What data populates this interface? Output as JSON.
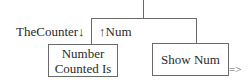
{
  "diagram": {
    "type": "structure-chart",
    "couples": {
      "left_label": "TheCounter↓",
      "right_label": "↑Num"
    },
    "modules": [
      {
        "id": "number-counted-is",
        "line1": "Number",
        "line2": "Counted Is"
      },
      {
        "id": "show-num",
        "label": "Show Num"
      }
    ],
    "continuation": "=>",
    "colors": {
      "line": "#6a6a6a",
      "text": "#2a2a2a",
      "background": "#ffffff"
    }
  }
}
